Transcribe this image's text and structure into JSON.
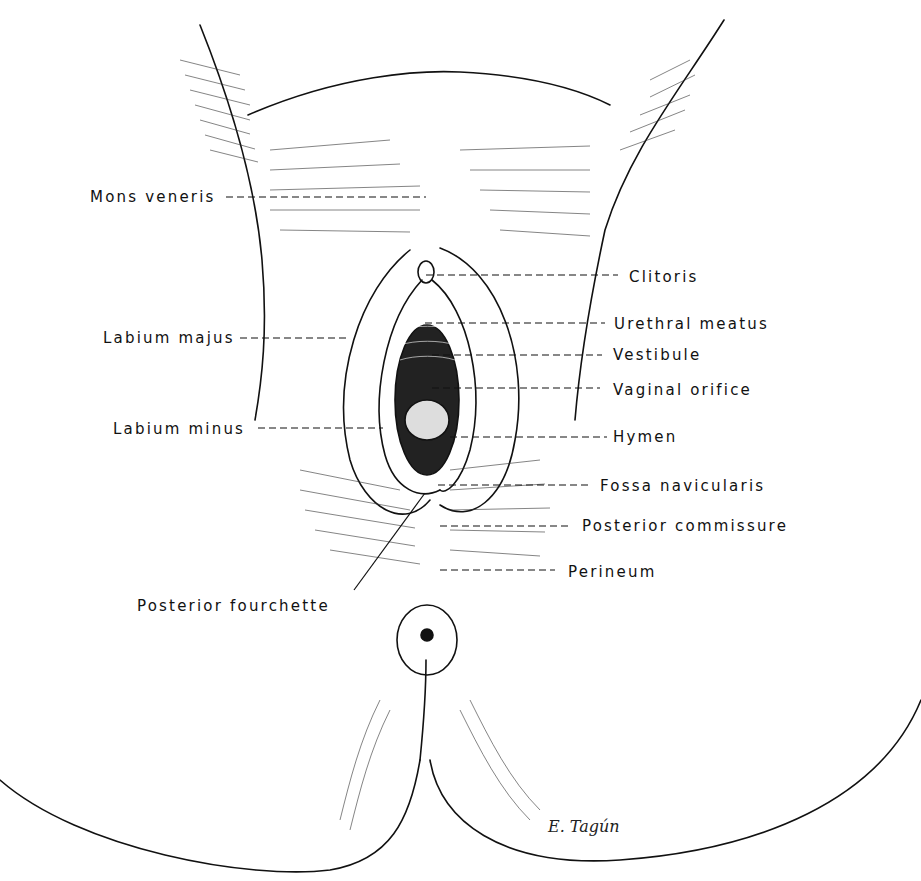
{
  "figure": {
    "type": "anatomical line drawing",
    "labels_left": [
      {
        "id": "mons-veneris",
        "text": "Mons veneris"
      },
      {
        "id": "labium-majus",
        "text": "Labium majus"
      },
      {
        "id": "labium-minus",
        "text": "Labium minus"
      },
      {
        "id": "posterior-fourchette",
        "text": "Posterior fourchette"
      }
    ],
    "labels_right": [
      {
        "id": "clitoris",
        "text": "Clitoris"
      },
      {
        "id": "urethral-meatus",
        "text": "Urethral meatus"
      },
      {
        "id": "vestibule",
        "text": "Vestibule"
      },
      {
        "id": "vaginal-orifice",
        "text": "Vaginal orifice"
      },
      {
        "id": "hymen",
        "text": "Hymen"
      },
      {
        "id": "fossa-navicularis",
        "text": "Fossa navicularis"
      },
      {
        "id": "posterior-commissure",
        "text": "Posterior commissure"
      },
      {
        "id": "perineum",
        "text": "Perineum"
      }
    ],
    "signature": "E. Tagún"
  },
  "colors": {
    "ink": "#111111",
    "background": "#ffffff"
  }
}
